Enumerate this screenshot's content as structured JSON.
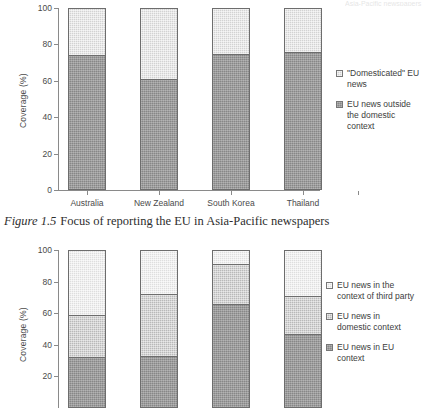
{
  "document": {
    "caption_figure_number": "Figure 1.5",
    "caption_text": "Focus of reporting the EU in Asia-Pacific newspapers",
    "scan_artifact_text": "Asia-Pacific newspapers"
  },
  "chart_data": [
    {
      "id": "top",
      "type": "bar",
      "stacked": true,
      "title": "",
      "xlabel": "",
      "ylabel": "Coverage (%)",
      "ylim": [
        0,
        100
      ],
      "yticks": [
        0,
        20,
        40,
        60,
        80,
        100
      ],
      "ytick_labels": [
        "0",
        "20",
        "40",
        "60",
        "80",
        "100"
      ],
      "grid": false,
      "legend_position": "right",
      "categories": [
        "Australia",
        "New Zealand",
        "South Korea",
        "Thailand"
      ],
      "series": [
        {
          "name": "EU news outside the domestic context",
          "legend_label": "EU news outside\nthe domestic\ncontext",
          "swatch": "dark",
          "color": "#878787",
          "values": [
            74,
            61,
            75,
            76
          ]
        },
        {
          "name": "\"Domesticated\" EU news",
          "legend_label": "\"Domesticated\" EU\nnews",
          "swatch": "light",
          "color": "#d2d2d2",
          "values": [
            26,
            39,
            25,
            24
          ]
        }
      ]
    },
    {
      "id": "bottom",
      "type": "bar",
      "stacked": true,
      "title": "",
      "xlabel": "",
      "ylabel": "Coverage (%)",
      "ylim": [
        0,
        100
      ],
      "yticks": [
        20,
        40,
        60,
        80,
        100
      ],
      "ytick_labels": [
        "20",
        "40",
        "60",
        "80",
        "100"
      ],
      "grid": false,
      "legend_position": "right",
      "categories": [
        "Australia",
        "New Zealand",
        "South Korea",
        "Thailand"
      ],
      "series": [
        {
          "name": "EU news in EU context",
          "legend_label": "EU news in EU\ncontext",
          "swatch": "dark",
          "color": "#878787",
          "values": [
            32,
            33,
            66,
            47
          ]
        },
        {
          "name": "EU news in domestic context",
          "legend_label": "EU news in\ndomestic context",
          "swatch": "mid",
          "color": "#b9b9b9",
          "values": [
            27,
            39,
            25,
            24
          ]
        },
        {
          "name": "EU news in the context of third party",
          "legend_label": "EU news in the\ncontext of third party",
          "swatch": "lighter",
          "color": "#dedede",
          "values": [
            41,
            28,
            9,
            29
          ]
        }
      ]
    }
  ],
  "charts": {
    "top": {
      "y_axis_title": "Coverage (%)",
      "ytick_labels": [
        "100",
        "80",
        "60",
        "40",
        "20",
        "0"
      ],
      "category_labels": [
        "Australia",
        "New Zealand",
        "South Korea",
        "Thailand"
      ],
      "legend": [
        {
          "label": "\"Domesticated\" EU\nnews",
          "swatch": "light"
        },
        {
          "label": "EU news outside\nthe domestic\ncontext",
          "swatch": "dark"
        }
      ]
    },
    "bottom": {
      "y_axis_title": "Coverage (%)",
      "ytick_labels": [
        "100",
        "80",
        "60",
        "40",
        "20"
      ],
      "category_labels": [
        "Australia",
        "New Zealand",
        "South Korea",
        "Thailand"
      ],
      "legend": [
        {
          "label": "EU news in the\ncontext of third party",
          "swatch": "lighter"
        },
        {
          "label": "EU news in\ndomestic context",
          "swatch": "mid"
        },
        {
          "label": "EU news in EU\ncontext",
          "swatch": "dark"
        }
      ]
    }
  }
}
